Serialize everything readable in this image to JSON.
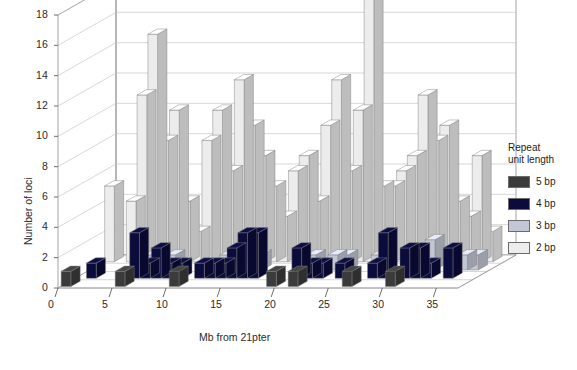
{
  "chart_data": {
    "type": "bar",
    "title": "",
    "xlabel": "Mb from 21pter",
    "ylabel": "Number of loci",
    "ylim": [
      0,
      18
    ],
    "xlim": [
      0,
      37
    ],
    "ytick_labels": [
      "0",
      "2",
      "4",
      "6",
      "8",
      "10",
      "12",
      "14",
      "16",
      "18"
    ],
    "ytick_values": [
      0,
      2,
      4,
      6,
      8,
      10,
      12,
      14,
      16,
      18
    ],
    "xtick_labels": [
      "0",
      "5",
      "10",
      "15",
      "20",
      "25",
      "30",
      "35"
    ],
    "xtick_values": [
      0,
      5,
      10,
      15,
      20,
      25,
      30,
      35
    ],
    "grid": true,
    "legend_position": "right",
    "legend_title": "Repeat\nunit length",
    "x": [
      0,
      1,
      2,
      3,
      4,
      5,
      6,
      7,
      8,
      9,
      10,
      11,
      12,
      13,
      14,
      15,
      16,
      17,
      18,
      19,
      20,
      21,
      22,
      23,
      24,
      25,
      26,
      27,
      28,
      29,
      30,
      31,
      32,
      33,
      34,
      35,
      36
    ],
    "series": [
      {
        "name": "5 bp",
        "color": "#3b3b3b",
        "values": [
          1,
          0,
          0,
          0,
          0,
          1,
          0,
          0,
          0,
          0,
          1,
          0,
          0,
          0,
          0,
          0,
          0,
          0,
          0,
          1,
          0,
          1,
          0,
          0,
          0,
          0,
          1,
          0,
          0,
          0,
          1,
          0,
          0,
          0,
          0,
          0,
          0
        ]
      },
      {
        "name": "4 bp",
        "color": "#0b0b3c",
        "values": [
          0,
          1,
          0,
          0,
          0,
          3,
          1,
          2,
          1,
          1,
          0,
          1,
          1,
          1,
          2,
          3,
          3,
          0,
          0,
          0,
          2,
          1,
          1,
          0,
          1,
          0,
          0,
          1,
          3,
          0,
          2,
          2,
          1,
          0,
          2,
          0,
          0
        ]
      },
      {
        "name": "3 bp",
        "color": "#c2c7d4",
        "values": [
          0,
          0,
          0,
          0,
          0,
          1,
          0,
          1,
          0,
          0,
          0,
          0,
          1,
          0,
          0,
          1,
          0,
          0,
          0,
          0,
          1,
          0,
          1,
          1,
          0,
          0,
          1,
          0,
          0,
          1,
          0,
          2,
          0,
          0,
          1,
          1,
          0
        ]
      },
      {
        "name": "2 bp",
        "color": "#ececec",
        "values": [
          5,
          0,
          4,
          11,
          15,
          8,
          10,
          4,
          2,
          8,
          10,
          6,
          12,
          9,
          7,
          5,
          3,
          6,
          7,
          4,
          9,
          12,
          6,
          10,
          18,
          5,
          5,
          6,
          7,
          11,
          8,
          9,
          4,
          3,
          7,
          2,
          0
        ]
      }
    ]
  },
  "legend": {
    "title_line1": "Repeat",
    "title_line2": "unit length",
    "items": [
      {
        "label": "5 bp",
        "color": "#3b3b3b"
      },
      {
        "label": "4 bp",
        "color": "#0b0b3c"
      },
      {
        "label": "3 bp",
        "color": "#c2c7d4"
      },
      {
        "label": "2 bp",
        "color": "#ececec"
      }
    ]
  },
  "axes": {
    "y_title": "Number of loci",
    "x_title": "Mb from 21pter"
  }
}
